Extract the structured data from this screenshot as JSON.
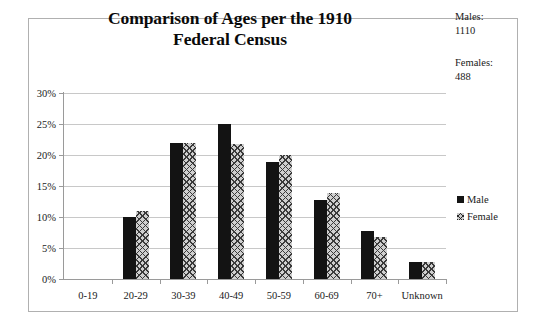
{
  "chart_data": {
    "type": "bar",
    "title": "Comparison of Ages per the 1910 Federal Census",
    "title_lines": [
      "Comparison of Ages per the 1910",
      "Federal Census"
    ],
    "xlabel": "",
    "ylabel": "",
    "categories": [
      "0-19",
      "20-29",
      "30-39",
      "40-49",
      "50-59",
      "60-69",
      "70+",
      "Unknown"
    ],
    "series": [
      {
        "name": "Male",
        "values": [
          0,
          10.0,
          21.9,
          25.0,
          18.9,
          12.8,
          7.8,
          2.7
        ]
      },
      {
        "name": "Female",
        "values": [
          0,
          10.9,
          21.9,
          21.8,
          20.0,
          13.8,
          6.7,
          2.7
        ]
      }
    ],
    "ylim": [
      0,
      30
    ],
    "ytick_values": [
      0,
      5,
      10,
      15,
      20,
      25,
      30
    ],
    "ytick_labels": [
      "0%",
      "5%",
      "10%",
      "15%",
      "20%",
      "25%",
      "30%"
    ],
    "grid": true,
    "legend_position": "right",
    "annotations": [
      {
        "label": "Males:",
        "value": "1110"
      },
      {
        "label": "Females:",
        "value": "488"
      }
    ]
  },
  "legend": {
    "items": [
      {
        "label": "Male",
        "swatch": "solid-black-square"
      },
      {
        "label": "Female",
        "swatch": "crosshatch-square"
      }
    ]
  },
  "notes": {
    "males_label": "Males:",
    "males_value": "1110",
    "females_label": "Females:",
    "females_value": "488"
  },
  "colors": {
    "male_bar": "#131313",
    "female_bar_fill": "#cfcfcf",
    "female_bar_hatch": "#3a3a3a",
    "gridline": "#c8c8c8",
    "axis": "#9a9a9a",
    "frame_border": "#b0b0b0",
    "text": "#1a1a1a",
    "background": "#ffffff"
  }
}
